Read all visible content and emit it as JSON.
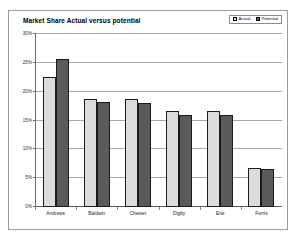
{
  "chart_data": {
    "type": "bar",
    "title": "Market Share Actual versus potential",
    "xlabel": "",
    "ylabel": "",
    "ylim": [
      0,
      30
    ],
    "ytick_labels": [
      "30%",
      "25%",
      "20%",
      "15%",
      "10%",
      "5%",
      "0%"
    ],
    "ytick_values": [
      30,
      25,
      20,
      15,
      10,
      5,
      0
    ],
    "grid": true,
    "legend_position": "top-right",
    "categories": [
      "Andrews",
      "Baldwin",
      "Chester",
      "Digby",
      "Erie",
      "Ferris"
    ],
    "series": [
      {
        "name": "Actual",
        "color": "#dcdcdc",
        "values": [
          22.5,
          18.8,
          18.7,
          16.6,
          16.7,
          6.8
        ]
      },
      {
        "name": "Potential",
        "color": "#5a5a5a",
        "values": [
          25.7,
          18.2,
          18.0,
          16.0,
          16.0,
          6.6
        ]
      }
    ]
  },
  "colors": {
    "actual": "#dcdcdc",
    "potential": "#5a5a5a",
    "bar_outline": "#1a1a1a",
    "gridline": "#a7a7a7",
    "frame_border": "#9a9a9a",
    "plot_background": "#ffffff"
  }
}
